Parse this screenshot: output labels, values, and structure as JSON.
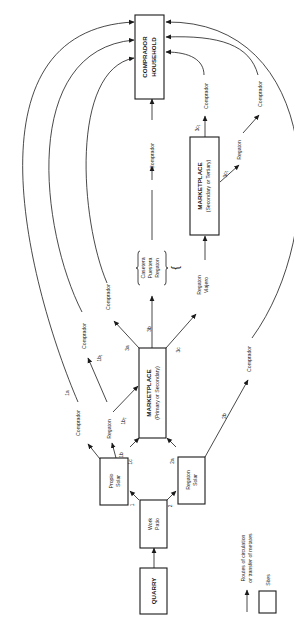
{
  "diagram": {
    "title": "",
    "nodes": {
      "quarry": {
        "label": "QUARRY"
      },
      "work_patio": {
        "line1": "Work",
        "line2": "Patio"
      },
      "propio_solar": {
        "line1": "Propio",
        "line2": "Solar"
      },
      "regaton_solar": {
        "line1": "Regaton",
        "line2": "Solar"
      },
      "marketplace_primary": {
        "line1": "MARKETPLACE",
        "line2": "(Primary or Secondary)"
      },
      "marketplace_secondary": {
        "line1": "MARKETPLACE",
        "line2": "(Secondary or Tertiary)"
      },
      "comprador_household": {
        "line1": "COMPRADOR",
        "line2": "HOUSEHOLD"
      },
      "brace_group": {
        "line1": "Casetera",
        "line2": "Puestera",
        "line3": "Regaton"
      },
      "regaton_viajero": {
        "line1": "Regaton",
        "line2": "Viajero"
      }
    },
    "route_labels": {
      "r1": "1",
      "r2": "2",
      "r1a": "1a",
      "r1b": "1b",
      "r1b1": "1b₁",
      "r1b2": "1b₂",
      "r1c": "1c",
      "r2a": "2a",
      "r2b": "2b",
      "r3a": "3a",
      "r3b": "3b",
      "r3c": "3c",
      "r3c1": "3c₁",
      "r3c2": "3c₂"
    },
    "agent_labels": {
      "comprador_1a": "Comprador",
      "regaton_1b": "Regaton",
      "comprador_1b1": "Comprador",
      "comprador_3a": "Comprador",
      "comprador_center": "Comprador",
      "comprador_2b": "Comprador",
      "comprador_3c1": "Comprador",
      "regaton_3c2": "Regaton",
      "comprador_3c2": "Comprador"
    },
    "legend": {
      "arrow_line1": "Routes of circulation",
      "arrow_line2": "or transfer of metates",
      "box_label": "Sites"
    }
  }
}
